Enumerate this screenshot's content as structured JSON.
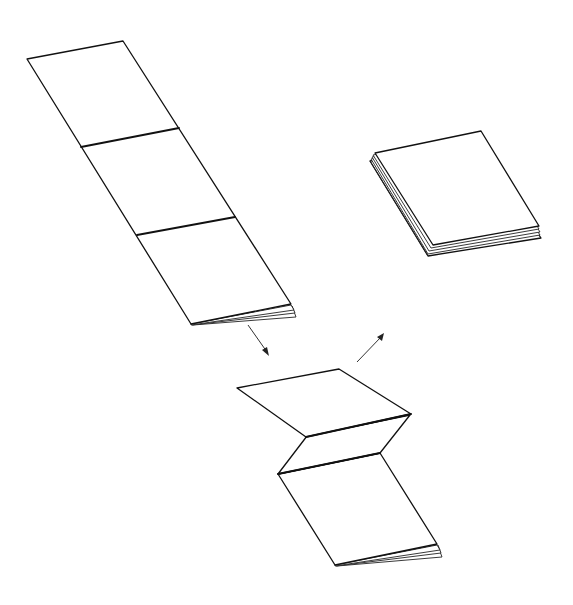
{
  "diagram": {
    "title": "",
    "colors": {
      "background": "#ffffff",
      "stroke": "#111111"
    },
    "steps": [
      {
        "id": "unfolded-strip",
        "label": "",
        "panels": 3
      },
      {
        "id": "zigzag-fold",
        "label": "",
        "panels": 3
      },
      {
        "id": "finished-booklet",
        "label": "",
        "panels": 1
      }
    ],
    "arrows": [
      {
        "from": "unfolded-strip",
        "to": "zigzag-fold",
        "direction": "down-right"
      },
      {
        "from": "zigzag-fold",
        "to": "finished-booklet",
        "direction": "up-right"
      }
    ]
  }
}
